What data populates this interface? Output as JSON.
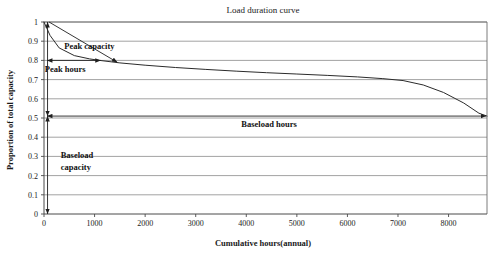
{
  "chart_data": {
    "type": "line",
    "title": "Load duration curve",
    "xlabel": "Cumulative hours(annual)",
    "ylabel": "Proportion of total capacity",
    "xlim": [
      0,
      8760
    ],
    "ylim": [
      0,
      1
    ],
    "grid": true,
    "legend": "none",
    "xticks": [
      0,
      1000,
      2000,
      3000,
      4000,
      5000,
      6000,
      7000,
      8000
    ],
    "xtick_labels": [
      "0",
      "1000",
      "2000",
      "3000",
      "4000",
      "5000",
      "6000",
      "7000",
      "8000"
    ],
    "yticks": [
      0,
      0.1,
      0.2,
      0.3,
      0.4,
      0.5,
      0.6,
      0.7,
      0.8,
      0.9,
      1
    ],
    "ytick_labels": [
      "0",
      "0.1",
      "0.2",
      "0.3",
      "0.4",
      "0.5",
      "0.6",
      "0.7",
      "0.8",
      "0.9",
      "1"
    ],
    "series": [
      {
        "name": "Load duration curve",
        "x": [
          0,
          120,
          300,
          600,
          900,
          1100,
          1500,
          2000,
          2600,
          3200,
          3800,
          4400,
          5000,
          5600,
          6200,
          6700,
          7100,
          7500,
          7900,
          8300,
          8600,
          8760
        ],
        "y": [
          1.0,
          0.93,
          0.865,
          0.825,
          0.808,
          0.8,
          0.787,
          0.775,
          0.763,
          0.753,
          0.744,
          0.736,
          0.729,
          0.722,
          0.714,
          0.705,
          0.695,
          0.672,
          0.633,
          0.578,
          0.525,
          0.51
        ]
      }
    ],
    "annotations": [
      {
        "name": "peak-capacity",
        "label": "Peak capacity",
        "type": "leader-line",
        "text_x": 400,
        "text_y": 0.875,
        "from_x": 100,
        "from_y": 1.0,
        "to_x": 1450,
        "to_y": 0.79
      },
      {
        "name": "peak-hours",
        "label": "Peak hours",
        "type": "double-arrow-horizontal",
        "text_x": 420,
        "text_y": 0.757,
        "arrow_y": 0.8,
        "arrow_x_start": 60,
        "arrow_x_end": 1120
      },
      {
        "name": "baseload-hours",
        "label": "Baseload hours",
        "type": "double-arrow-horizontal",
        "text_x": 4450,
        "text_y": 0.468,
        "arrow_y": 0.51,
        "arrow_x_start": 60,
        "arrow_x_end": 8740
      },
      {
        "name": "baseload-capacity",
        "label": "Baseload capacity",
        "label_line_1": "Baseload",
        "label_line_2": "capacity",
        "type": "double-arrow-vertical",
        "text_x": 330,
        "text_y_1": 0.305,
        "text_y_2": 0.243,
        "arrow_x": 70,
        "arrow_y_start": 0.51,
        "arrow_y_end": 0.0
      },
      {
        "name": "peak-capacity-range",
        "label": "",
        "type": "double-arrow-vertical",
        "arrow_x": 70,
        "arrow_y_start": 1.0,
        "arrow_y_end": 0.51
      }
    ],
    "colors": {
      "curve": "#2b2b2b",
      "grid": "#8a8a8a",
      "frame": "#6e6e6e",
      "text": "#1a1a1a",
      "background": "#ffffff"
    }
  }
}
